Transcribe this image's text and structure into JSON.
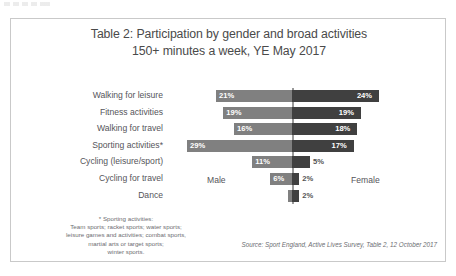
{
  "chart_data": {
    "type": "bar",
    "subtype": "diverging-horizontal-bar",
    "title": "Table 2: Participation by gender and broad activities",
    "subtitle": "150+ minutes a week, YE May 2017",
    "xlabel": "",
    "ylabel": "",
    "grid": false,
    "axis_center_label": "0%",
    "categories": [
      "Walking for leisure",
      "Fitness activities",
      "Walking for travel",
      "Sporting activities*",
      "Cycling (leisure/sport)",
      "Cycling for travel",
      "Dance"
    ],
    "series": [
      {
        "name": "Male",
        "direction": "left",
        "color": "#808080",
        "values": [
          21,
          19,
          16,
          29,
          11,
          6,
          1
        ],
        "labels": [
          "21%",
          "19%",
          "16%",
          "29%",
          "11%",
          "6%",
          ""
        ]
      },
      {
        "name": "Female",
        "direction": "right",
        "color": "#404040",
        "values": [
          24,
          19,
          18,
          17,
          5,
          2,
          2
        ],
        "labels": [
          "24%",
          "19%",
          "18%",
          "17%",
          "5%",
          "2%",
          "2%"
        ]
      }
    ],
    "legend": {
      "position": "inline-center",
      "entries": [
        "Male",
        "Female"
      ]
    },
    "xlim": [
      -30,
      30
    ],
    "value_suffix": "%"
  },
  "footnote": {
    "lines": [
      "* Sporting activities:",
      "Team sports; racket sports; water sports;",
      "leisure games and activities; combat sports,",
      "martial arts or target sports;",
      "winter sports."
    ]
  },
  "source": {
    "text": "Source: Sport England, Active Lives Survey, Table 2, 12 October 2017"
  },
  "colors": {
    "male_bar": "#808080",
    "female_bar": "#404040",
    "frame_border": "#c9c9c9",
    "axis_line": "#9a9a9a",
    "title_text": "#4a4a4a",
    "label_text": "#55555a",
    "note_text": "#6d6d72"
  }
}
